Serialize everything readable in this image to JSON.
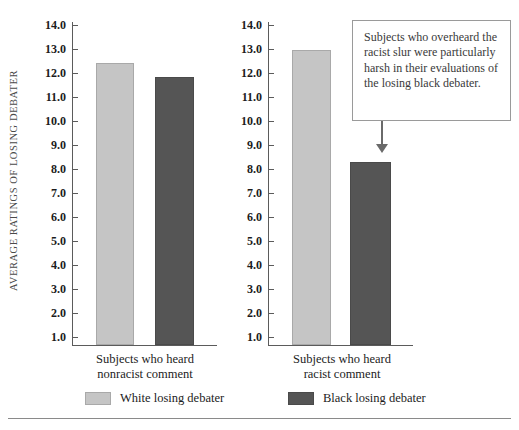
{
  "chart_data": {
    "type": "bar",
    "title": "",
    "xlabel": "",
    "ylabel": "AVERAGE RATINGS OF LOSING DEBATER",
    "ylim": [
      0,
      14.0
    ],
    "ytick_labels": [
      "14.0",
      "13.0",
      "12.0",
      "11.0",
      "10.0",
      "9.0",
      "8.0",
      "7.0",
      "6.0",
      "5.0",
      "4.0",
      "3.0",
      "2.0",
      "1.0"
    ],
    "ytick_values": [
      14.0,
      13.0,
      12.0,
      11.0,
      10.0,
      9.0,
      8.0,
      7.0,
      6.0,
      5.0,
      4.0,
      3.0,
      2.0,
      1.0
    ],
    "grid": false,
    "legend_position": "bottom",
    "categories": [
      "Subjects who heard nonracist comment",
      "Subjects who heard racist comment"
    ],
    "series": [
      {
        "name": "White losing debater",
        "color": "#c5c5c5",
        "values": [
          12.4,
          12.95
        ]
      },
      {
        "name": "Black losing debater",
        "color": "#555555",
        "values": [
          11.85,
          8.3
        ]
      }
    ],
    "annotations": [
      {
        "text": "Subjects who overheard the racist slur were particularly harsh in their evaluations of the losing black debater.",
        "points_to": "Black losing debater bar, racist comment panel"
      }
    ]
  },
  "panels": [
    {
      "caption_line1": "Subjects who heard",
      "caption_line2": "nonracist comment",
      "bars": [
        {
          "series": "White losing debater",
          "value": 12.4
        },
        {
          "series": "Black losing debater",
          "value": 11.85
        }
      ]
    },
    {
      "caption_line1": "Subjects who heard",
      "caption_line2": "racist comment",
      "bars": [
        {
          "series": "White losing debater",
          "value": 12.95
        },
        {
          "series": "Black losing debater",
          "value": 8.3
        }
      ]
    }
  ],
  "axis": {
    "label": "AVERAGE RATINGS OF LOSING DEBATER",
    "ticks": [
      "14.0",
      "13.0",
      "12.0",
      "11.0",
      "10.0",
      "9.0",
      "8.0",
      "7.0",
      "6.0",
      "5.0",
      "4.0",
      "3.0",
      "2.0",
      "1.0"
    ]
  },
  "callout": {
    "text": "Subjects who overheard the racist slur were particularly harsh in their evaluations of the losing black debater."
  },
  "legend": {
    "items": [
      {
        "label": "White losing debater",
        "color": "#c5c5c5"
      },
      {
        "label": "Black losing debater",
        "color": "#555555"
      }
    ]
  },
  "colors": {
    "white_debater": "#c5c5c5",
    "black_debater": "#555555",
    "axis": "#5b5b5b",
    "text": "#1c1c1c"
  }
}
